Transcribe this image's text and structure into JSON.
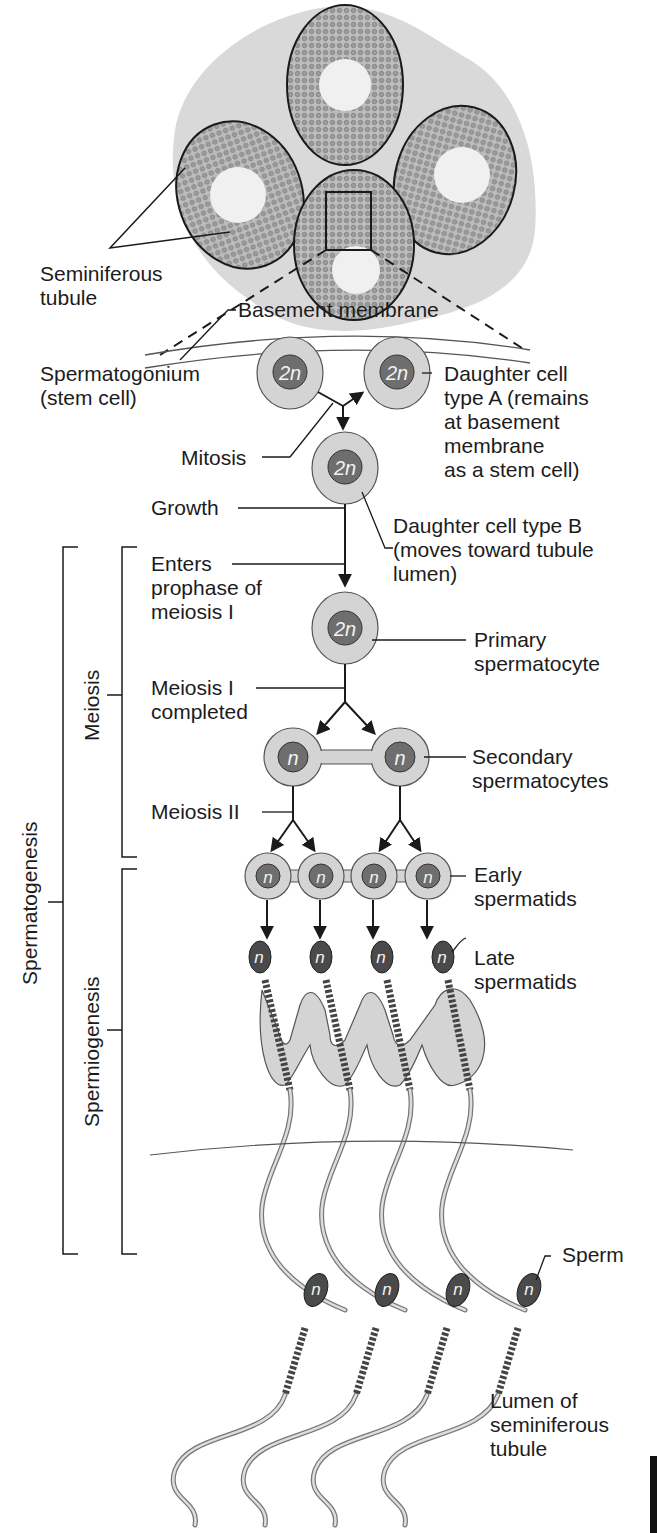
{
  "figure": {
    "labels": {
      "seminiferous_tubule": "Seminiferous\ntubule",
      "basement_membrane": "Basement membrane",
      "spermatogonium": "Spermatogonium\n(stem cell)",
      "daughter_a": "Daughter cell\ntype A (remains\nat basement\nmembrane\nas a stem cell)",
      "mitosis": "Mitosis",
      "growth": "Growth",
      "daughter_b": "Daughter cell type B\n(moves toward tubule\nlumen)",
      "enters_prophase": "Enters\nprophase of\nmeiosis I",
      "primary_spermatocyte": "Primary\nspermatocyte",
      "meiosis_i_completed": "Meiosis I\ncompleted",
      "secondary_spermatocytes": "Secondary\nspermatocytes",
      "meiosis_ii": "Meiosis II",
      "early_spermatids": "Early\nspermatids",
      "late_spermatids": "Late\nspermatids",
      "sperm": "Sperm",
      "lumen": "Lumen of\nseminiferous\ntubule"
    },
    "brackets": {
      "spermatogenesis": "Spermatogenesis",
      "meiosis": "Meiosis",
      "spermiogenesis": "Spermiogenesis"
    },
    "ploidy": {
      "diploid": "2n",
      "haploid": "n"
    },
    "colors": {
      "tissue": "#d9d9d9",
      "cell_outer": "#d4d4d4",
      "nucleus": "#6e6e6e",
      "sperm_head": "#4a4a4a",
      "line": "#1a1a1a"
    }
  }
}
